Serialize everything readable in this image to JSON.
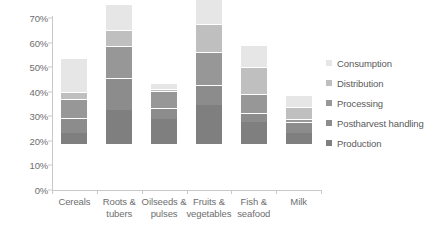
{
  "chart_data": {
    "type": "bar",
    "subtype": "stacked-bar",
    "title": "",
    "xlabel": "",
    "ylabel": "",
    "ylim": [
      0,
      70
    ],
    "y_tick_step": 10,
    "y_tick_labels": [
      "0%",
      "10%",
      "20%",
      "30%",
      "40%",
      "50%",
      "60%",
      "70%"
    ],
    "y_tick_values": [
      0,
      10,
      20,
      30,
      40,
      50,
      60,
      70
    ],
    "grid": false,
    "legend_position": "right",
    "categories": [
      "Cereals",
      "Roots & tubers",
      "Oilseeds & pulses",
      "Fruits & vegetables",
      "Fish & seafood",
      "Milk"
    ],
    "category_lines": [
      [
        "Cereals"
      ],
      [
        "Roots &",
        "tubers"
      ],
      [
        "Oilseeds &",
        "pulses"
      ],
      [
        "Fruits &",
        "vegetables"
      ],
      [
        "Fish &",
        "seafood"
      ],
      [
        "Milk"
      ]
    ],
    "series": [
      {
        "name": "Production",
        "color": "#7f7f7f",
        "values": [
          4.5,
          14.0,
          10.0,
          16.0,
          9.0,
          4.5
        ]
      },
      {
        "name": "Postharvest handling",
        "color": "#8c8c8c",
        "values": [
          6.0,
          13.0,
          4.5,
          8.0,
          3.5,
          4.5
        ]
      },
      {
        "name": "Processing",
        "color": "#979797",
        "values": [
          8.0,
          13.0,
          7.0,
          13.5,
          8.0,
          1.0
        ]
      },
      {
        "name": "Distribution",
        "color": "#bfbfbf",
        "values": [
          2.5,
          6.5,
          1.0,
          11.5,
          11.0,
          5.0
        ]
      },
      {
        "name": "Consumption",
        "color": "#e6e6e6",
        "values": [
          14.0,
          10.5,
          2.5,
          14.0,
          9.0,
          5.0
        ]
      }
    ],
    "totals": [
      35.0,
      57.0,
      25.0,
      63.0,
      40.5,
      20.0
    ],
    "legend_order_top_to_bottom": [
      "Consumption",
      "Distribution",
      "Processing",
      "Postharvest handling",
      "Production"
    ]
  },
  "colors": {
    "axis": "#c9c9c9",
    "text": "#5a5a5a",
    "background": "#ffffff"
  }
}
